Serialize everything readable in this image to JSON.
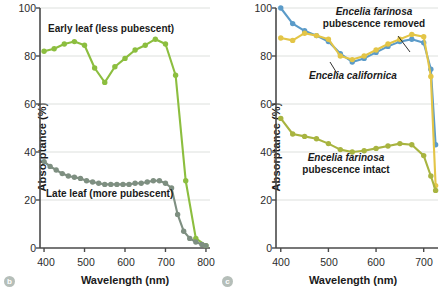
{
  "figure": {
    "panels": [
      {
        "badge": "b",
        "ylabel": "Absorptance (%)",
        "xlabel": "Wavelength (nm)",
        "annotations": [
          {
            "name": "early-leaf-label",
            "text": "Early leaf (less pubescent)"
          },
          {
            "name": "late-leaf-label",
            "text": "Late leaf (more pubescent)"
          }
        ]
      },
      {
        "badge": "c",
        "ylabel": "Absorptance (%)",
        "xlabel": "Wavelength (nm)",
        "annotations": [
          {
            "name": "farinosa-removed-label-line1",
            "text": "Encelia farinosa"
          },
          {
            "name": "farinosa-removed-label-line2",
            "text": "pubescence removed"
          },
          {
            "name": "californica-label",
            "text": "Encelia californica"
          },
          {
            "name": "farinosa-intact-label-line1",
            "text": "Encelia farinosa"
          },
          {
            "name": "farinosa-intact-label-line2",
            "text": "pubescence intact"
          }
        ]
      }
    ]
  },
  "chart_data": [
    {
      "panel": "b",
      "type": "line",
      "title": "",
      "xlabel": "Wavelength (nm)",
      "ylabel": "Absorptance (%)",
      "xlim": [
        390,
        810
      ],
      "ylim": [
        0,
        100
      ],
      "xticks": [
        400,
        500,
        600,
        700,
        800
      ],
      "yticks": [
        0,
        20,
        40,
        60,
        80,
        100
      ],
      "grid": "horizontal",
      "legend": "in-plot annotations",
      "series": [
        {
          "name": "Early leaf (less pubescent)",
          "color": "#8CBE3F",
          "x": [
            400,
            425,
            450,
            475,
            500,
            525,
            550,
            575,
            600,
            625,
            650,
            675,
            700,
            725,
            750,
            775,
            800
          ],
          "y": [
            82,
            83,
            85,
            86,
            84.5,
            75,
            69,
            75.5,
            79,
            82.5,
            84.5,
            87,
            85,
            72,
            28,
            4,
            1
          ]
        },
        {
          "name": "Late leaf (more pubescent)",
          "color": "#7E8F81",
          "x": [
            400,
            415,
            430,
            445,
            460,
            475,
            490,
            505,
            520,
            535,
            550,
            565,
            580,
            595,
            610,
            625,
            640,
            655,
            670,
            685,
            700,
            715,
            730,
            745,
            760,
            775,
            790,
            800
          ],
          "y": [
            36,
            34,
            32.5,
            31,
            30,
            29.5,
            29,
            28,
            27.5,
            27,
            26.5,
            26.5,
            26.5,
            26.5,
            26.5,
            27,
            27,
            27.5,
            28,
            28,
            27,
            25,
            14,
            7,
            4,
            2.5,
            1.5,
            1
          ]
        }
      ]
    },
    {
      "panel": "c",
      "type": "line",
      "title": "",
      "xlabel": "Wavelength (nm)",
      "ylabel": "Absorptance (%)",
      "xlim": [
        390,
        730
      ],
      "ylim": [
        0,
        100
      ],
      "xticks": [
        400,
        500,
        600,
        700
      ],
      "yticks": [
        0,
        20,
        40,
        60,
        80,
        100
      ],
      "grid": "horizontal",
      "legend": "in-plot annotations",
      "series": [
        {
          "name": "Encelia californica",
          "color": "#5B9BC9",
          "x": [
            400,
            425,
            450,
            475,
            500,
            525,
            550,
            575,
            600,
            625,
            650,
            675,
            700,
            715,
            725
          ],
          "y": [
            100,
            93.5,
            90.5,
            88.5,
            86,
            81,
            77.5,
            79,
            81.5,
            84,
            86,
            87,
            85.5,
            74.5,
            43
          ]
        },
        {
          "name": "Encelia farinosa pubescence removed",
          "color": "#E3C547",
          "x": [
            400,
            425,
            450,
            475,
            500,
            525,
            550,
            575,
            600,
            625,
            650,
            675,
            700,
            715,
            725
          ],
          "y": [
            87.5,
            86.5,
            89.5,
            88.5,
            87,
            80,
            78.5,
            80,
            82.5,
            85,
            87,
            89,
            88,
            71.5,
            26
          ]
        },
        {
          "name": "Encelia farinosa pubescence intact",
          "color": "#A8B440",
          "x": [
            400,
            425,
            450,
            475,
            500,
            525,
            550,
            575,
            600,
            625,
            650,
            675,
            700,
            715,
            725
          ],
          "y": [
            54,
            47.5,
            46.5,
            45.5,
            43.5,
            41,
            40,
            40.5,
            41.5,
            42.5,
            43.5,
            43,
            38.5,
            30,
            24
          ]
        }
      ]
    }
  ]
}
